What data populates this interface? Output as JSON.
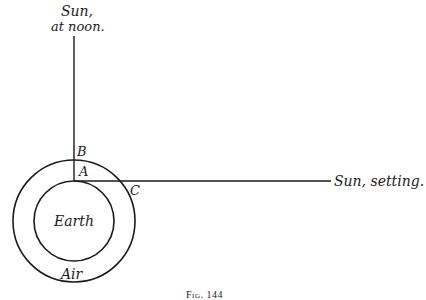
{
  "diagram": {
    "labels": {
      "sun_noon_line1": "Sun,",
      "sun_noon_line2": "at noon.",
      "sun_setting": "Sun, setting.",
      "point_a": "A",
      "point_b": "B",
      "point_c": "C",
      "earth": "Earth",
      "air": "Air"
    },
    "caption": "Fig. 144",
    "colors": {
      "stroke": "#1a1a1a",
      "background": "#ffffff"
    }
  }
}
